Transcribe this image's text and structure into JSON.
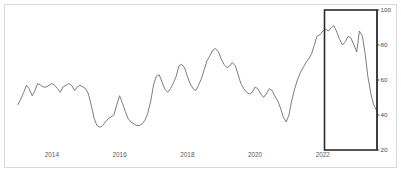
{
  "chart_data": {
    "type": "line",
    "title": "",
    "subtitle": "",
    "xlabel": "",
    "ylabel": "",
    "grid": false,
    "legend": null,
    "legend_position": "none",
    "y_axis_side": "right",
    "ylim": [
      20,
      100
    ],
    "xlim": [
      2013.0,
      2023.6
    ],
    "yticks": [
      100,
      80,
      60,
      40,
      20
    ],
    "ytick_labels": [
      "100",
      "80",
      "60",
      "40",
      "20"
    ],
    "xticks": [
      2014,
      2016,
      2018,
      2020,
      2022
    ],
    "xtick_labels": [
      "2014",
      "2016",
      "2018",
      "2020",
      "2022"
    ],
    "line_color": "#6e6e6e",
    "line_width": 0.9,
    "series": [
      {
        "name": "series-1",
        "x": [
          2013.0,
          2013.08,
          2013.17,
          2013.25,
          2013.33,
          2013.42,
          2013.5,
          2013.58,
          2013.67,
          2013.75,
          2013.83,
          2013.92,
          2014.0,
          2014.08,
          2014.17,
          2014.25,
          2014.33,
          2014.42,
          2014.5,
          2014.58,
          2014.67,
          2014.75,
          2014.83,
          2014.92,
          2015.0,
          2015.08,
          2015.17,
          2015.25,
          2015.33,
          2015.42,
          2015.5,
          2015.58,
          2015.67,
          2015.75,
          2015.83,
          2015.92,
          2016.0,
          2016.08,
          2016.17,
          2016.25,
          2016.33,
          2016.42,
          2016.5,
          2016.58,
          2016.67,
          2016.75,
          2016.83,
          2016.92,
          2017.0,
          2017.08,
          2017.17,
          2017.25,
          2017.33,
          2017.42,
          2017.5,
          2017.58,
          2017.67,
          2017.75,
          2017.83,
          2017.92,
          2018.0,
          2018.08,
          2018.17,
          2018.25,
          2018.33,
          2018.42,
          2018.5,
          2018.58,
          2018.67,
          2018.75,
          2018.83,
          2018.92,
          2019.0,
          2019.08,
          2019.17,
          2019.25,
          2019.33,
          2019.42,
          2019.5,
          2019.58,
          2019.67,
          2019.75,
          2019.83,
          2019.92,
          2020.0,
          2020.08,
          2020.17,
          2020.25,
          2020.33,
          2020.42,
          2020.5,
          2020.58,
          2020.67,
          2020.75,
          2020.83,
          2020.92,
          2021.0,
          2021.08,
          2021.17,
          2021.25,
          2021.33,
          2021.42,
          2021.5,
          2021.58,
          2021.67,
          2021.75,
          2021.83,
          2021.92,
          2022.0,
          2022.08,
          2022.17,
          2022.25,
          2022.33,
          2022.42,
          2022.5,
          2022.58,
          2022.67,
          2022.75,
          2022.83,
          2022.92,
          2023.0,
          2023.08,
          2023.17,
          2023.25,
          2023.33,
          2023.42,
          2023.5,
          2023.6
        ],
        "values": [
          46,
          49,
          53,
          57,
          55,
          51,
          54,
          58,
          57,
          56,
          56,
          57,
          58,
          57,
          55,
          53,
          56,
          57,
          58,
          57,
          54,
          56,
          57,
          56,
          55,
          52,
          45,
          38,
          34,
          33,
          34,
          36,
          38,
          39,
          40,
          46,
          51,
          47,
          42,
          38,
          36,
          35,
          34,
          34,
          35,
          37,
          41,
          48,
          57,
          62,
          63,
          59,
          55,
          53,
          55,
          58,
          62,
          68,
          69,
          67,
          62,
          58,
          55,
          54,
          57,
          61,
          66,
          71,
          74,
          77,
          78,
          76,
          72,
          69,
          67,
          68,
          70,
          68,
          63,
          58,
          55,
          53,
          52,
          53,
          56,
          55,
          52,
          50,
          52,
          55,
          54,
          51,
          48,
          44,
          39,
          36,
          40,
          48,
          55,
          60,
          64,
          67,
          70,
          72,
          75,
          80,
          85,
          86,
          88,
          89,
          88,
          90,
          91,
          87,
          83,
          80,
          82,
          85,
          84,
          80,
          76,
          88,
          85,
          75,
          62,
          52,
          46,
          42
        ]
      }
    ],
    "annotations": [
      {
        "kind": "highlight-rectangle",
        "x_start": 2022.05,
        "x_end": 2023.6,
        "y_start": 20,
        "y_end": 100,
        "stroke_color": "#2b2b2b",
        "stroke_width": 1.6,
        "fill": "none"
      }
    ]
  },
  "figure": {
    "background": "#ffffff",
    "frame_color": "#d9d9d9",
    "axis_color": "#3a3a3a",
    "tick_label_color": "#4a4a4a"
  }
}
